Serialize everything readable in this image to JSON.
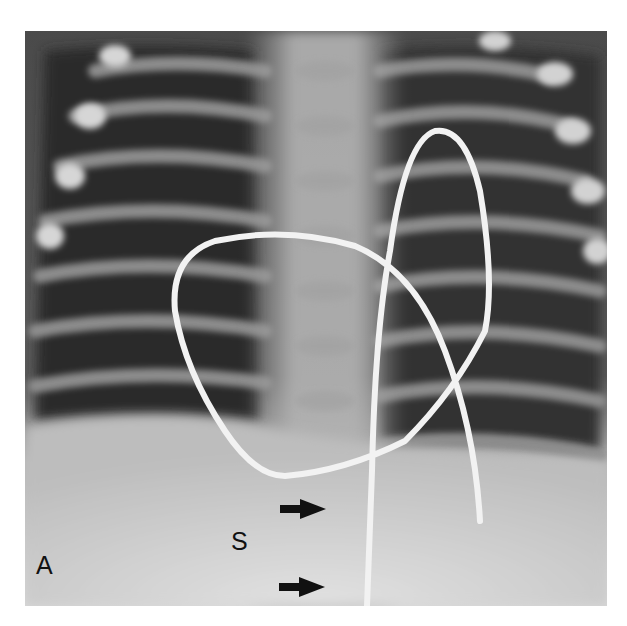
{
  "figure": {
    "panel_label": "A",
    "annotation_label": "S",
    "arrows": [
      {
        "name": "upper-arrow",
        "direction": "right"
      },
      {
        "name": "lower-arrow",
        "direction": "right"
      }
    ],
    "colors": {
      "background": "#ffffff",
      "lung_dark": "#2a2a2a",
      "bone_light": "#d8d8d8",
      "catheter": "#f4f4f4",
      "abdomen": "#d2d2d2",
      "label": "#111111"
    }
  }
}
